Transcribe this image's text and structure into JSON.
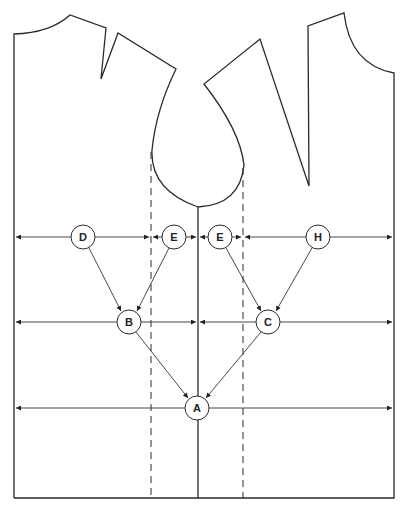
{
  "diagram": {
    "colors": {
      "line": "#2a2a2a",
      "background": "#ffffff"
    },
    "nodes": [
      {
        "id": "D",
        "label": "D",
        "x": 83,
        "y": 237
      },
      {
        "id": "E1",
        "label": "E",
        "x": 174,
        "y": 237
      },
      {
        "id": "E2",
        "label": "E",
        "x": 220,
        "y": 237
      },
      {
        "id": "H",
        "label": "H",
        "x": 318,
        "y": 237
      },
      {
        "id": "B",
        "label": "B",
        "x": 129,
        "y": 322
      },
      {
        "id": "C",
        "label": "C",
        "x": 268,
        "y": 322
      },
      {
        "id": "A",
        "label": "A",
        "x": 197,
        "y": 408
      }
    ],
    "edges": [
      {
        "from": "D",
        "to": "B"
      },
      {
        "from": "E1",
        "to": "B"
      },
      {
        "from": "E2",
        "to": "C"
      },
      {
        "from": "H",
        "to": "C"
      },
      {
        "from": "B",
        "to": "A"
      },
      {
        "from": "C",
        "to": "A"
      }
    ],
    "measure_rows": [
      {
        "name": "chest-line",
        "y": 237
      },
      {
        "name": "waist-line",
        "y": 322
      },
      {
        "name": "hip-line",
        "y": 408
      }
    ]
  }
}
